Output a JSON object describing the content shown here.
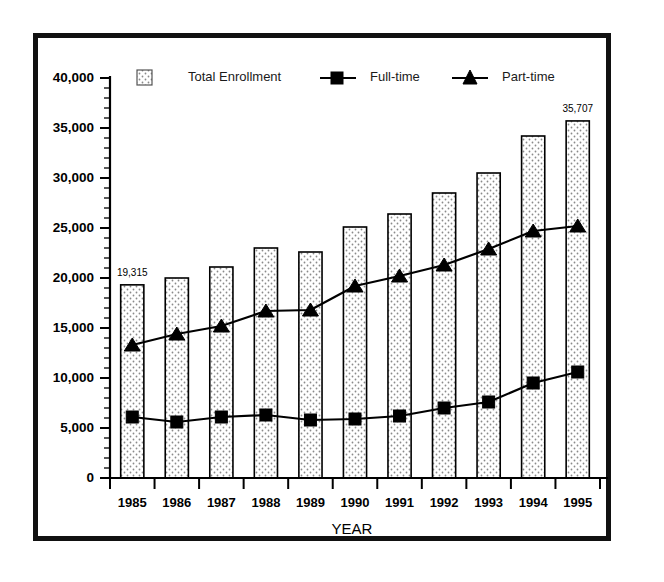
{
  "chart_data": {
    "type": "bar",
    "title": "",
    "xlabel": "YEAR",
    "ylabel": "",
    "categories": [
      "1985",
      "1986",
      "1987",
      "1988",
      "1989",
      "1990",
      "1991",
      "1992",
      "1993",
      "1994",
      "1995"
    ],
    "ylim": [
      0,
      40000
    ],
    "ytick_labels": [
      "0",
      "5,000",
      "10,000",
      "15,000",
      "20,000",
      "25,000",
      "30,000",
      "35,000",
      "40,000"
    ],
    "ytick_values": [
      0,
      5000,
      10000,
      15000,
      20000,
      25000,
      30000,
      35000,
      40000
    ],
    "minor_tick_interval": 1000,
    "grid": false,
    "legend_position": "top",
    "series": [
      {
        "name": "Total Enrollment",
        "kind": "bar",
        "marker": "dotted-square",
        "values": [
          19315,
          20000,
          21100,
          23000,
          22600,
          25100,
          26400,
          28500,
          30500,
          34200,
          35707
        ]
      },
      {
        "name": "Full-time",
        "kind": "line",
        "marker": "square",
        "values": [
          6100,
          5600,
          6100,
          6300,
          5800,
          5900,
          6200,
          7000,
          7600,
          9500,
          10600
        ]
      },
      {
        "name": "Part-time",
        "kind": "line",
        "marker": "triangle",
        "values": [
          13300,
          14400,
          15200,
          16700,
          16800,
          19200,
          20200,
          21300,
          22900,
          24700,
          25200
        ]
      }
    ],
    "annotations": [
      {
        "series": "Total Enrollment",
        "category": "1985",
        "text": "19,315"
      },
      {
        "series": "Total Enrollment",
        "category": "1995",
        "text": "35,707"
      }
    ]
  },
  "colors": {
    "frame": "#111111",
    "axis": "#000000",
    "bar_stroke": "#000000",
    "bar_fill": "#f0f0f0",
    "line": "#000000",
    "background": "#ffffff"
  }
}
